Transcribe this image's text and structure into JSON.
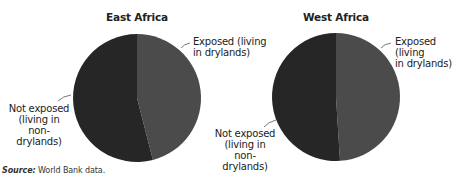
{
  "colors": {
    "exposed": "#4b4b4b",
    "not_exposed": "#262626",
    "leader": "#555555"
  },
  "charts": [
    {
      "title": "East Africa",
      "exposed_label": [
        "Exposed (living",
        "in drylands)"
      ],
      "not_exposed_label": [
        "Not exposed",
        "(living in",
        "non-drylands)"
      ]
    },
    {
      "title": "West Africa",
      "exposed_label": [
        "Exposed (living",
        "in drylands)"
      ],
      "not_exposed_label": [
        "Not exposed",
        "(living in",
        "non-drylands)"
      ]
    }
  ],
  "source": {
    "prefix": "Source:",
    "text": " World Bank data."
  },
  "chart_data": [
    {
      "type": "pie",
      "title": "East Africa",
      "categories": [
        "Exposed (living in drylands)",
        "Not exposed (living in non-drylands)"
      ],
      "values": [
        46,
        54
      ],
      "unit": "percent (estimated)",
      "start_angle": "12 o'clock, clockwise"
    },
    {
      "type": "pie",
      "title": "West Africa",
      "categories": [
        "Exposed (living in drylands)",
        "Not exposed (living in non-drylands)"
      ],
      "values": [
        49,
        51
      ],
      "unit": "percent (estimated)",
      "start_angle": "12 o'clock, clockwise"
    }
  ]
}
